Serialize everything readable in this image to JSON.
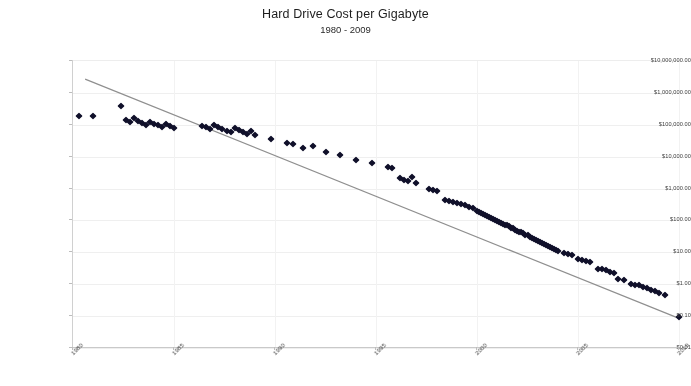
{
  "chart": {
    "title": "Hard Drive Cost per Gigabyte",
    "subtitle": "1980 - 2009",
    "annotation": "Matthew Komorowski"
  },
  "chart_data": {
    "type": "scatter",
    "title": "Hard Drive Cost per Gigabyte",
    "subtitle": "1980 - 2009",
    "annotation": "Matthew Komorowski",
    "xlabel": "",
    "ylabel": "",
    "yscale": "log",
    "ylim": [
      0.01,
      10000000
    ],
    "xlim": [
      1980,
      2010
    ],
    "grid": true,
    "legend": false,
    "ytick_labels": [
      "$10,000,000.00",
      "$1,000,000.00",
      "$100,000.00",
      "$10,000.00",
      "$1,000.00",
      "$100.00",
      "$10.00",
      "$1.00",
      "$0.10",
      "$0.01"
    ],
    "ytick_values": [
      10000000,
      1000000,
      100000,
      10000,
      1000,
      100,
      10,
      1,
      0.1,
      0.01
    ],
    "xtick_labels": [
      "1980",
      "1985",
      "1990",
      "1995",
      "2000",
      "2005",
      "2010"
    ],
    "xtick_values": [
      1980,
      1985,
      1990,
      1995,
      2000,
      2005,
      2010
    ],
    "marker": "diamond",
    "marker_color": "#10102a",
    "trendline": {
      "color": "#8f8f8f",
      "start": [
        1980.6,
        2700000
      ],
      "end": [
        2010.0,
        0.085
      ]
    },
    "series": [
      {
        "name": "Cost per Gigabyte",
        "points": [
          [
            1980.3,
            193000
          ],
          [
            1981.0,
            190000
          ],
          [
            1982.4,
            380000
          ],
          [
            1982.6,
            140000
          ],
          [
            1982.8,
            120000
          ],
          [
            1983.0,
            160000
          ],
          [
            1983.2,
            132000
          ],
          [
            1983.4,
            112000
          ],
          [
            1983.6,
            96000
          ],
          [
            1983.8,
            122000
          ],
          [
            1984.0,
            108000
          ],
          [
            1984.2,
            99000
          ],
          [
            1984.4,
            88000
          ],
          [
            1984.6,
            105000
          ],
          [
            1984.8,
            92000
          ],
          [
            1985.0,
            80000
          ],
          [
            1986.4,
            92000
          ],
          [
            1986.6,
            84000
          ],
          [
            1986.8,
            76000
          ],
          [
            1987.0,
            100000
          ],
          [
            1987.2,
            88000
          ],
          [
            1987.4,
            72000
          ],
          [
            1987.6,
            66000
          ],
          [
            1987.8,
            60000
          ],
          [
            1988.0,
            80000
          ],
          [
            1988.2,
            70000
          ],
          [
            1988.4,
            58000
          ],
          [
            1988.6,
            52000
          ],
          [
            1988.8,
            64000
          ],
          [
            1989.0,
            48000
          ],
          [
            1989.8,
            36000
          ],
          [
            1990.6,
            26000
          ],
          [
            1990.9,
            24500
          ],
          [
            1991.4,
            19000
          ],
          [
            1991.9,
            22000
          ],
          [
            1992.5,
            14500
          ],
          [
            1993.2,
            11000
          ],
          [
            1994.0,
            7800
          ],
          [
            1994.8,
            6400
          ],
          [
            1995.6,
            4600
          ],
          [
            1995.8,
            4300
          ],
          [
            1996.2,
            2100
          ],
          [
            1996.4,
            1900
          ],
          [
            1996.6,
            1750
          ],
          [
            1996.8,
            2300
          ],
          [
            1997.0,
            1500
          ],
          [
            1997.6,
            960
          ],
          [
            1997.8,
            880
          ],
          [
            1998.0,
            820
          ],
          [
            1998.4,
            430
          ],
          [
            1998.6,
            400
          ],
          [
            1998.8,
            370
          ],
          [
            1999.0,
            350
          ],
          [
            1999.2,
            320
          ],
          [
            1999.4,
            300
          ],
          [
            1999.6,
            270
          ],
          [
            1999.8,
            250
          ],
          [
            2000.0,
            200
          ],
          [
            2000.1,
            185
          ],
          [
            2000.2,
            175
          ],
          [
            2000.3,
            165
          ],
          [
            2000.4,
            150
          ],
          [
            2000.5,
            140
          ],
          [
            2000.6,
            130
          ],
          [
            2000.7,
            120
          ],
          [
            2000.8,
            112
          ],
          [
            2000.9,
            105
          ],
          [
            2001.0,
            98
          ],
          [
            2001.1,
            92
          ],
          [
            2001.2,
            86
          ],
          [
            2001.3,
            80
          ],
          [
            2001.4,
            74
          ],
          [
            2001.5,
            70
          ],
          [
            2001.6,
            65
          ],
          [
            2001.7,
            60
          ],
          [
            2001.8,
            56
          ],
          [
            2001.9,
            52
          ],
          [
            2002.0,
            48
          ],
          [
            2002.1,
            45
          ],
          [
            2002.2,
            42
          ],
          [
            2002.3,
            39
          ],
          [
            2002.4,
            36
          ],
          [
            2002.5,
            34
          ],
          [
            2002.6,
            31
          ],
          [
            2002.7,
            29
          ],
          [
            2002.8,
            27
          ],
          [
            2002.9,
            25
          ],
          [
            2003.0,
            23
          ],
          [
            2003.1,
            21.5
          ],
          [
            2003.2,
            20
          ],
          [
            2003.3,
            18.5
          ],
          [
            2003.4,
            17
          ],
          [
            2003.5,
            16
          ],
          [
            2003.6,
            15
          ],
          [
            2003.7,
            14
          ],
          [
            2003.8,
            13
          ],
          [
            2003.9,
            12
          ],
          [
            2004.0,
            11
          ],
          [
            2004.3,
            9.5
          ],
          [
            2004.5,
            8.8
          ],
          [
            2004.7,
            8.0
          ],
          [
            2005.0,
            6.2
          ],
          [
            2005.2,
            5.8
          ],
          [
            2005.4,
            5.4
          ],
          [
            2005.6,
            5.0
          ],
          [
            2006.0,
            3.1
          ],
          [
            2006.2,
            2.9
          ],
          [
            2006.4,
            2.7
          ],
          [
            2006.6,
            2.5
          ],
          [
            2006.8,
            2.3
          ],
          [
            2007.0,
            1.45
          ],
          [
            2007.3,
            1.35
          ],
          [
            2007.6,
            1.05
          ],
          [
            2007.8,
            0.98
          ],
          [
            2008.0,
            0.92
          ],
          [
            2008.2,
            0.8
          ],
          [
            2008.4,
            0.74
          ],
          [
            2008.6,
            0.68
          ],
          [
            2008.8,
            0.62
          ],
          [
            2009.0,
            0.55
          ],
          [
            2009.3,
            0.45
          ],
          [
            2010.0,
            0.095
          ]
        ]
      }
    ]
  }
}
